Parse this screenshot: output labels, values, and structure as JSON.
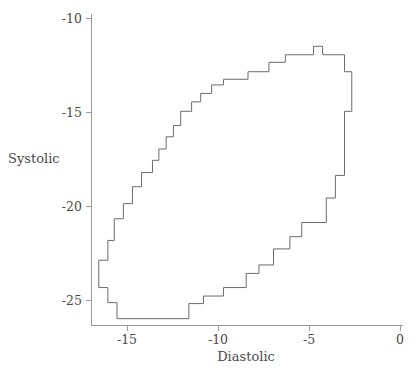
{
  "chart_data": {
    "type": "line",
    "title": "",
    "subtitle": "",
    "xlabel": "Diastolic",
    "ylabel": "Systolic",
    "xlim": [
      -17.5,
      0.8
    ],
    "ylim": [
      -27.2,
      -9.2
    ],
    "xticks": [
      -15,
      -10,
      -5,
      0
    ],
    "xticklabels": [
      "-15",
      "-10",
      "-5",
      "0"
    ],
    "yticks": [
      -10,
      -15,
      -20,
      -25
    ],
    "yticklabels": [
      "-10",
      "-15",
      "-20",
      "-25"
    ],
    "grid": false,
    "legend": null,
    "series": [
      {
        "name": "highest-density-region-boundary",
        "closed": true,
        "stroke": "#6b6b6b",
        "points": [
          [
            -16.55,
            -22.85
          ],
          [
            -16.05,
            -22.85
          ],
          [
            -16.05,
            -21.8
          ],
          [
            -15.7,
            -21.8
          ],
          [
            -15.7,
            -20.65
          ],
          [
            -15.2,
            -20.65
          ],
          [
            -15.2,
            -19.85
          ],
          [
            -14.7,
            -19.85
          ],
          [
            -14.7,
            -18.95
          ],
          [
            -14.2,
            -18.95
          ],
          [
            -14.2,
            -18.2
          ],
          [
            -13.6,
            -18.2
          ],
          [
            -13.6,
            -17.55
          ],
          [
            -13.25,
            -17.55
          ],
          [
            -13.25,
            -16.95
          ],
          [
            -12.85,
            -16.95
          ],
          [
            -12.85,
            -16.3
          ],
          [
            -12.45,
            -16.3
          ],
          [
            -12.45,
            -15.7
          ],
          [
            -12.05,
            -15.7
          ],
          [
            -12.05,
            -14.95
          ],
          [
            -11.45,
            -14.95
          ],
          [
            -11.45,
            -14.45
          ],
          [
            -10.95,
            -14.45
          ],
          [
            -10.95,
            -14.0
          ],
          [
            -10.35,
            -14.0
          ],
          [
            -10.35,
            -13.55
          ],
          [
            -9.7,
            -13.55
          ],
          [
            -9.7,
            -13.25
          ],
          [
            -8.35,
            -13.25
          ],
          [
            -8.35,
            -12.85
          ],
          [
            -7.2,
            -12.85
          ],
          [
            -7.2,
            -12.35
          ],
          [
            -6.3,
            -12.35
          ],
          [
            -6.3,
            -11.95
          ],
          [
            -4.75,
            -11.95
          ],
          [
            -4.75,
            -11.5
          ],
          [
            -4.25,
            -11.5
          ],
          [
            -4.25,
            -11.95
          ],
          [
            -3.05,
            -11.95
          ],
          [
            -3.05,
            -12.85
          ],
          [
            -2.65,
            -12.85
          ],
          [
            -2.65,
            -14.95
          ],
          [
            -3.05,
            -14.95
          ],
          [
            -3.05,
            -18.35
          ],
          [
            -3.55,
            -18.35
          ],
          [
            -3.55,
            -19.55
          ],
          [
            -4.05,
            -19.55
          ],
          [
            -4.05,
            -20.85
          ],
          [
            -5.4,
            -20.85
          ],
          [
            -5.4,
            -21.6
          ],
          [
            -6.05,
            -21.6
          ],
          [
            -6.05,
            -22.25
          ],
          [
            -6.95,
            -22.25
          ],
          [
            -6.95,
            -23.1
          ],
          [
            -7.75,
            -23.1
          ],
          [
            -7.75,
            -23.55
          ],
          [
            -8.45,
            -23.55
          ],
          [
            -8.45,
            -24.3
          ],
          [
            -9.7,
            -24.3
          ],
          [
            -9.7,
            -24.75
          ],
          [
            -10.8,
            -24.75
          ],
          [
            -10.8,
            -25.15
          ],
          [
            -11.6,
            -25.15
          ],
          [
            -11.6,
            -25.95
          ],
          [
            -15.55,
            -25.95
          ],
          [
            -15.55,
            -25.1
          ],
          [
            -16.05,
            -25.1
          ],
          [
            -16.05,
            -24.3
          ],
          [
            -16.55,
            -24.3
          ],
          [
            -16.55,
            -22.85
          ]
        ]
      }
    ]
  },
  "axes": {
    "x_axis_name": "diastolic-axis",
    "y_axis_name": "systolic-axis"
  }
}
